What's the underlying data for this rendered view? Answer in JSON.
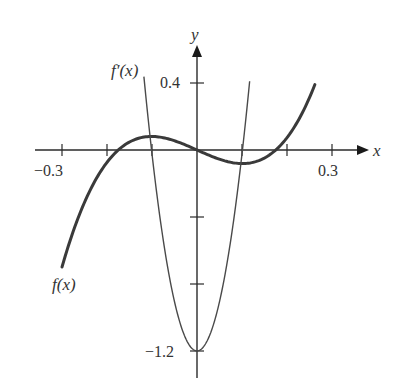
{
  "chart_data": {
    "type": "line",
    "title": "",
    "xlabel": "x",
    "ylabel": "y",
    "xlim": [
      -0.36,
      0.38
    ],
    "ylim": [
      -1.36,
      0.62
    ],
    "grid": false,
    "legend": "none (inline curve labels)",
    "x_ticks": [
      -0.3,
      -0.2,
      -0.1,
      0.1,
      0.2,
      0.3
    ],
    "x_tick_labels": [
      {
        "value": -0.3,
        "label": "−0.3"
      },
      {
        "value": 0.3,
        "label": "0.3"
      }
    ],
    "y_ticks": [
      0.4,
      -0.4,
      -0.8,
      -1.2
    ],
    "y_tick_labels": [
      {
        "value": 0.4,
        "label": "0.4"
      },
      {
        "value": -1.2,
        "label": "−1.2"
      }
    ],
    "series": [
      {
        "name": "f(x)",
        "label": "f(x)",
        "formula": "39.2*x*(x^2 - 0.0306)",
        "x_range": [
          -0.3,
          0.262
        ],
        "stroke_width": 3,
        "points": [
          [
            -0.3,
            -0.7
          ],
          [
            -0.25,
            -0.31
          ],
          [
            -0.2,
            -0.07
          ],
          [
            -0.175,
            0.0
          ],
          [
            -0.15,
            0.05
          ],
          [
            -0.101,
            0.08
          ],
          [
            -0.05,
            0.055
          ],
          [
            0.0,
            0.0
          ],
          [
            0.05,
            -0.055
          ],
          [
            0.101,
            -0.08
          ],
          [
            0.15,
            -0.05
          ],
          [
            0.175,
            0.0
          ],
          [
            0.2,
            0.07
          ],
          [
            0.25,
            0.31
          ],
          [
            0.262,
            0.38
          ]
        ]
      },
      {
        "name": "f'(x)",
        "label": "f′(x)",
        "formula": "39.2*(3x^2 - 0.0306)",
        "x_range": [
          -0.118,
          0.117
        ],
        "stroke_width": 1.5,
        "points": [
          [
            -0.118,
            0.44
          ],
          [
            -0.101,
            0.0
          ],
          [
            -0.075,
            -0.54
          ],
          [
            -0.05,
            -0.91
          ],
          [
            0.0,
            -1.2
          ],
          [
            0.05,
            -0.91
          ],
          [
            0.075,
            -0.54
          ],
          [
            0.101,
            0.0
          ],
          [
            0.117,
            0.41
          ]
        ]
      }
    ]
  },
  "axes": {
    "x_label": "x",
    "y_label": "y",
    "x_tick_label_neg": "−0.3",
    "x_tick_label_pos": "0.3",
    "y_tick_label_top": "0.4",
    "y_tick_label_bottom": "−1.2"
  },
  "labels": {
    "f": "f(x)",
    "fprime": "f′(x)"
  },
  "colors": {
    "axis": "#2a2a2a",
    "f_curve": "#3a3a3a",
    "fprime_curve": "#4a4a4a",
    "text": "#333333"
  }
}
